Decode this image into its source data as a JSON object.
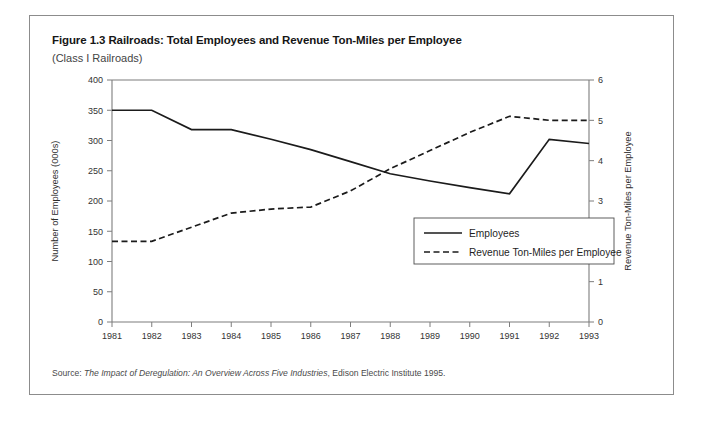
{
  "figure": {
    "title": "Figure 1.3 Railroads: Total Employees and Revenue Ton-Miles per Employee",
    "subtitle": "(Class I Railroads)",
    "source_prefix": "Source: ",
    "source_italic": "The Impact of Deregulation: An Overview Across Five Industries",
    "source_suffix": ", Edison Electric Institute 1995."
  },
  "chart_data": {
    "type": "line",
    "title": "Figure 1.3 Railroads: Total Employees and Revenue Ton-Miles per Employee",
    "subtitle": "(Class I Railroads)",
    "xlabel": "Years",
    "ylabel": "Number of Employees (000s)",
    "y2label": "Revenue Ton-Miles per Employee",
    "x": [
      1981,
      1982,
      1983,
      1984,
      1985,
      1986,
      1987,
      1988,
      1989,
      1990,
      1991,
      1992,
      1993
    ],
    "xtick_labels": [
      "1981",
      "1982",
      "1983",
      "1984",
      "1985",
      "1986",
      "1987",
      "1988",
      "1989",
      "1990",
      "1991",
      "1992",
      "1993"
    ],
    "ylim": [
      0,
      400
    ],
    "yticks": [
      0,
      50,
      100,
      150,
      200,
      250,
      300,
      350,
      400
    ],
    "ytick_labels": [
      "0",
      "50",
      "100",
      "150",
      "200",
      "250",
      "300",
      "350",
      "400"
    ],
    "y2lim": [
      0,
      6
    ],
    "y2ticks": [
      0,
      1,
      2,
      3,
      4,
      5,
      6
    ],
    "y2tick_labels": [
      "0",
      "1",
      "2",
      "3",
      "4",
      "5",
      "6"
    ],
    "grid": false,
    "legend_position": "center-right",
    "series": [
      {
        "name": "Employees",
        "axis": "left",
        "style": "solid",
        "color": "#1b1b1b",
        "values": [
          350,
          350,
          318,
          318,
          302,
          285,
          265,
          245,
          233,
          222,
          212,
          302,
          295
        ]
      },
      {
        "name": "Revenue Ton-Miles per Employee",
        "axis": "right",
        "style": "dashed",
        "color": "#1b1b1b",
        "values": [
          2.0,
          2.0,
          2.35,
          2.7,
          2.8,
          2.85,
          3.25,
          3.8,
          4.25,
          4.7,
          5.1,
          5.0,
          5.0
        ]
      }
    ]
  }
}
